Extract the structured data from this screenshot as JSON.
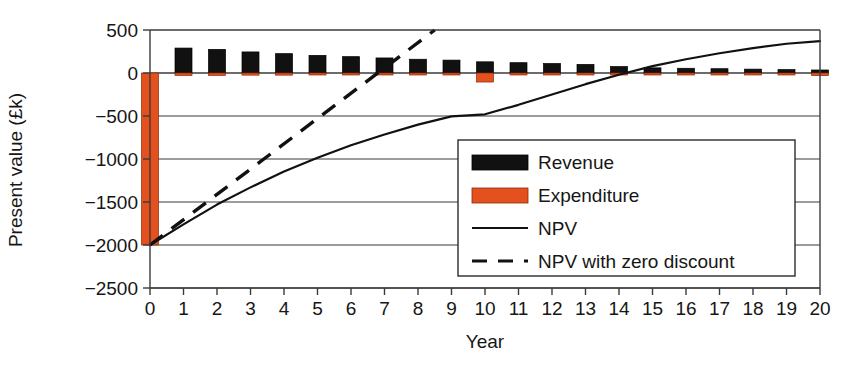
{
  "chart_data": {
    "type": "bar",
    "title": "",
    "xlabel": "Year",
    "ylabel": "Present value (£k)",
    "xlim": [
      0,
      20
    ],
    "ylim": [
      -2500,
      500
    ],
    "ytick_values": [
      500,
      0,
      -500,
      -1000,
      -1500,
      -2000,
      -2500
    ],
    "ytick_labels": [
      "500",
      "0",
      "−500",
      "−1000",
      "−1500",
      "−2000",
      "−2500"
    ],
    "xtick_labels": [
      "0",
      "1",
      "2",
      "3",
      "4",
      "5",
      "6",
      "7",
      "8",
      "9",
      "10",
      "11",
      "12",
      "13",
      "14",
      "15",
      "16",
      "17",
      "18",
      "19",
      "20"
    ],
    "grid": true,
    "grid_axis": "y",
    "legend_position": "center-right",
    "categories": [
      0,
      1,
      2,
      3,
      4,
      5,
      6,
      7,
      8,
      9,
      10,
      11,
      12,
      13,
      14,
      15,
      16,
      17,
      18,
      19,
      20
    ],
    "series": [
      {
        "name": "Revenue",
        "color": "#111111",
        "kind": "bar",
        "values": [
          0,
          290,
          275,
          245,
          225,
          205,
          190,
          175,
          160,
          150,
          130,
          120,
          110,
          100,
          75,
          60,
          55,
          50,
          45,
          40,
          35
        ]
      },
      {
        "name": "Expenditure",
        "color": "#E4511E",
        "kind": "bar",
        "values": [
          -2000,
          -28,
          -28,
          -25,
          -25,
          -22,
          -22,
          -20,
          -18,
          -18,
          -105,
          -16,
          -15,
          -14,
          -12,
          -10,
          -10,
          -9,
          -9,
          -8,
          -30
        ]
      },
      {
        "name": "NPV",
        "color": "#111111",
        "kind": "line",
        "style": "solid",
        "x": [
          0,
          1,
          2,
          3,
          4,
          5,
          6,
          7,
          8,
          9,
          10,
          11,
          12,
          13,
          14,
          15,
          16,
          17,
          18,
          19,
          20
        ],
        "values": [
          -2000,
          -1760,
          -1530,
          -1330,
          -1145,
          -985,
          -840,
          -715,
          -600,
          -505,
          -480,
          -370,
          -250,
          -130,
          -20,
          80,
          160,
          230,
          290,
          340,
          370
        ]
      },
      {
        "name": "NPV with zero discount",
        "color": "#111111",
        "kind": "line",
        "style": "dashed",
        "x": [
          0,
          8.5
        ],
        "values": [
          -2000,
          500
        ]
      }
    ],
    "legend_entries": [
      {
        "label": "Revenue",
        "marker": "bar",
        "color": "#111111"
      },
      {
        "label": "Expenditure",
        "marker": "bar",
        "color": "#E4511E"
      },
      {
        "label": "NPV",
        "marker": "line-solid",
        "color": "#111111"
      },
      {
        "label": "NPV with zero discount",
        "marker": "line-dashed",
        "color": "#111111"
      }
    ]
  }
}
